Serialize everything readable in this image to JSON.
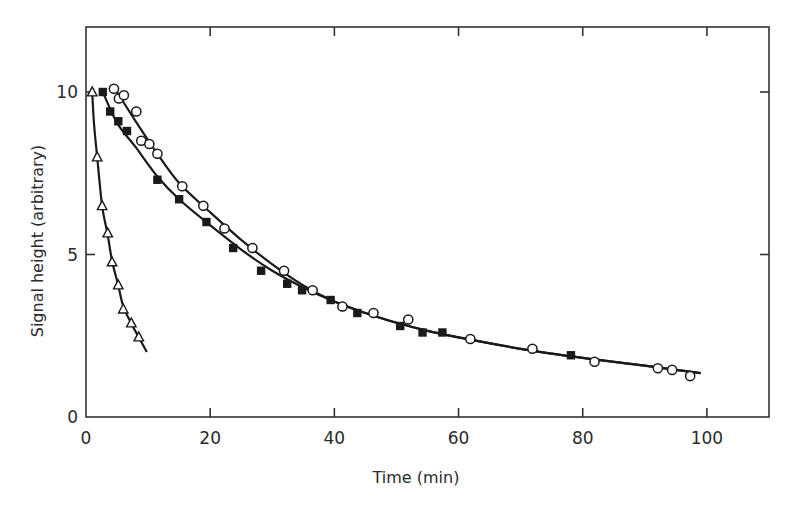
{
  "chart_data": {
    "type": "scatter",
    "title": "",
    "xlabel": "Time (min)",
    "ylabel": "Signal height (arbitrary)",
    "xlim": [
      0,
      110
    ],
    "ylim": [
      0,
      12
    ],
    "x_ticks": [
      0,
      20,
      40,
      60,
      80,
      100
    ],
    "y_ticks": [
      0,
      5,
      10
    ],
    "x_tick_labels": [
      "0",
      "20",
      "40",
      "60",
      "80",
      "100"
    ],
    "y_tick_labels": [
      "0",
      "5",
      "10"
    ],
    "grid": false,
    "legend": null,
    "frame": "box with ticks on all four sides",
    "series": [
      {
        "name": "triangles",
        "marker": "open-triangle",
        "fit_curve": true,
        "curve_range": [
          1.0,
          9.8
        ],
        "x": [
          1.0,
          1.8,
          2.6,
          3.5,
          4.2,
          5.2,
          6.0,
          7.3,
          8.5
        ],
        "y": [
          10.0,
          8.0,
          6.5,
          5.66,
          4.77,
          4.06,
          3.32,
          2.89,
          2.46
        ],
        "curve": [
          [
            1.0,
            10.0
          ],
          [
            1.3,
            9.0
          ],
          [
            1.8,
            8.0
          ],
          [
            2.6,
            6.5
          ],
          [
            3.5,
            5.6
          ],
          [
            4.2,
            4.8
          ],
          [
            5.2,
            4.05
          ],
          [
            6.0,
            3.4
          ],
          [
            7.3,
            2.88
          ],
          [
            8.5,
            2.45
          ],
          [
            9.8,
            2.0
          ]
        ]
      },
      {
        "name": "filled squares",
        "marker": "filled-square",
        "fit_curve": true,
        "curve_range": [
          2.7,
          99
        ],
        "x": [
          2.7,
          3.9,
          5.2,
          6.6,
          11.5,
          15.0,
          19.4,
          23.7,
          28.2,
          32.4,
          34.8,
          39.4,
          43.7,
          50.6,
          54.2,
          57.4,
          78.1
        ],
        "y": [
          10.0,
          9.4,
          9.1,
          8.8,
          7.3,
          6.7,
          6.0,
          5.2,
          4.5,
          4.1,
          3.9,
          3.6,
          3.2,
          2.8,
          2.6,
          2.6,
          1.9
        ],
        "curve": [
          [
            2.7,
            10.0
          ],
          [
            5,
            9.05
          ],
          [
            8,
            8.3
          ],
          [
            11.5,
            7.4
          ],
          [
            15,
            6.7
          ],
          [
            20,
            5.9
          ],
          [
            25,
            5.15
          ],
          [
            30,
            4.5
          ],
          [
            35,
            3.98
          ],
          [
            40,
            3.55
          ],
          [
            45,
            3.2
          ],
          [
            50,
            2.9
          ],
          [
            55,
            2.65
          ],
          [
            60,
            2.45
          ],
          [
            70,
            2.1
          ],
          [
            80,
            1.82
          ],
          [
            90,
            1.58
          ],
          [
            99,
            1.35
          ]
        ]
      },
      {
        "name": "open circles",
        "marker": "open-circle",
        "fit_curve": true,
        "curve_range": [
          5.0,
          99
        ],
        "x": [
          4.5,
          5.3,
          6.1,
          8.1,
          8.9,
          10.2,
          11.5,
          15.5,
          18.9,
          22.3,
          26.8,
          31.9,
          36.5,
          41.3,
          46.3,
          51.9,
          61.9,
          71.9,
          81.9,
          92.1,
          94.4,
          97.3
        ],
        "y": [
          10.1,
          9.8,
          9.9,
          9.4,
          8.5,
          8.4,
          8.1,
          7.1,
          6.5,
          5.8,
          5.2,
          4.5,
          3.9,
          3.4,
          3.2,
          3.0,
          2.4,
          2.1,
          1.7,
          1.5,
          1.45,
          1.26
        ],
        "curve": [
          [
            5.0,
            10.0
          ],
          [
            8,
            9.1
          ],
          [
            11.5,
            8.1
          ],
          [
            15,
            7.2
          ],
          [
            20,
            6.3
          ],
          [
            25,
            5.45
          ],
          [
            30,
            4.7
          ],
          [
            35,
            4.05
          ],
          [
            40,
            3.55
          ],
          [
            45,
            3.2
          ],
          [
            50,
            2.9
          ],
          [
            55,
            2.65
          ],
          [
            60,
            2.45
          ],
          [
            70,
            2.1
          ],
          [
            80,
            1.82
          ],
          [
            90,
            1.58
          ],
          [
            99,
            1.35
          ]
        ]
      }
    ]
  }
}
